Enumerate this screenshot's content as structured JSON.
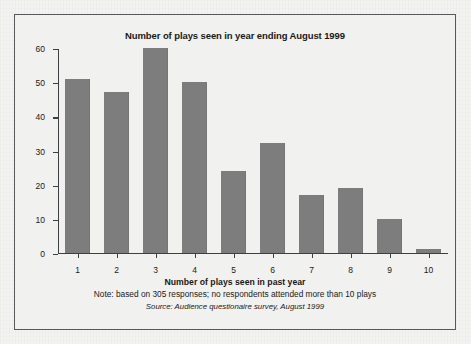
{
  "chart_data": {
    "type": "bar",
    "title": "Number of plays seen in year ending August 1999",
    "xlabel": "Number of plays seen in past year",
    "ylabel": "Number of respondents",
    "categories": [
      "1",
      "2",
      "3",
      "4",
      "5",
      "6",
      "7",
      "8",
      "9",
      "10"
    ],
    "values": [
      51,
      47,
      60,
      50,
      24,
      32,
      17,
      19,
      10,
      1
    ],
    "ylim": [
      0,
      60
    ],
    "yticks": [
      0,
      10,
      20,
      30,
      40,
      50,
      60
    ],
    "grid": false,
    "legend": null,
    "bar_color": "#7d7d7d",
    "axis_color": "#3c4043",
    "annotations": {
      "note": "Note: based on 305 responses; no respondents attended more than 10 plays",
      "source": "Source: Audience questionaire survey, August 1999"
    }
  }
}
